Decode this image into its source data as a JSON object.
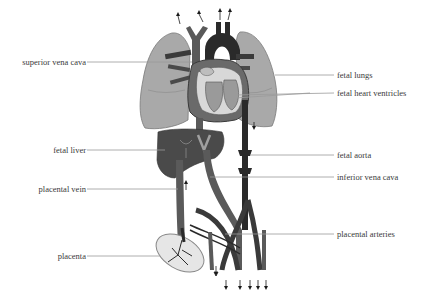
{
  "labels": {
    "superior_vena_cava": "superior vena cava",
    "fetal_lungs": "fetal lungs",
    "fetal_heart_ventricles": "fetal heart ventricles",
    "fetal_liver": "fetal liver",
    "fetal_aorta": "fetal aorta",
    "inferior_vena_cava": "inferior vena cava",
    "placental_vein": "placental vein",
    "placental_arteries": "placental arteries",
    "placenta": "placenta"
  },
  "colors": {
    "lung": "#a9a9a9",
    "lung_outline": "#7a7a7a",
    "heart_dark": "#2a2a2a",
    "vessel_mid": "#5a5a5a",
    "liver": "#4a4a4a",
    "leader_line": "#9a9a9a",
    "text": "#3a3a3a"
  }
}
